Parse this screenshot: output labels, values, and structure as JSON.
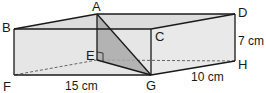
{
  "figure": {
    "type": "cuboid",
    "colors": {
      "face_light": "#e6e6e6",
      "face_top": "#dcdcdc",
      "face_right": "#e9e9e9",
      "triangle_fill": "#a9a9a9",
      "edge": "#1a1a1a",
      "hidden_edge": "#555555"
    },
    "vertices": {
      "A": {
        "label": "A",
        "x": 97,
        "y": 14
      },
      "B": {
        "label": "B",
        "x": 14,
        "y": 29
      },
      "C": {
        "label": "C",
        "x": 151,
        "y": 29
      },
      "D": {
        "label": "D",
        "x": 235,
        "y": 14
      },
      "E": {
        "label": "E",
        "x": 97,
        "y": 60
      },
      "F": {
        "label": "F",
        "x": 14,
        "y": 75
      },
      "G": {
        "label": "G",
        "x": 151,
        "y": 75
      },
      "H": {
        "label": "H",
        "x": 235,
        "y": 61
      }
    },
    "shaded_triangle": [
      "A",
      "E",
      "G"
    ],
    "right_angle_at": "E",
    "hidden_edges": [
      [
        "E",
        "F"
      ],
      [
        "E",
        "H"
      ]
    ],
    "dimensions": {
      "length": "15 cm",
      "width": "10 cm",
      "height": "7 cm"
    }
  }
}
